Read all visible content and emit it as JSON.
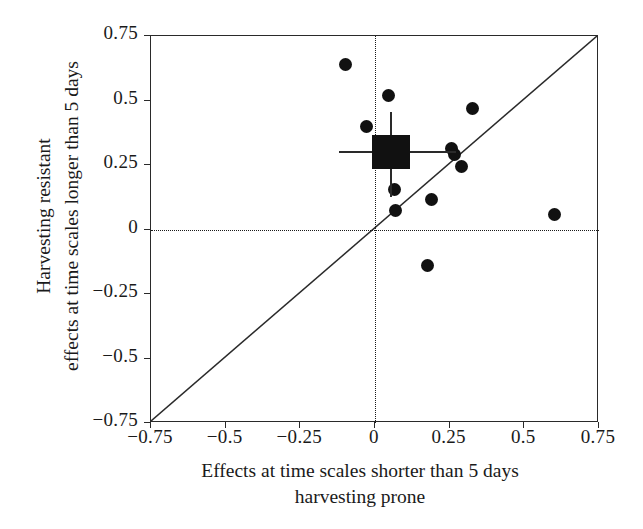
{
  "chart_data": {
    "type": "scatter",
    "title": "",
    "xlabel": "Effects at time scales shorter than 5 days harvesting prone",
    "xlabel_line1": "Effects at time scales shorter than 5 days",
    "xlabel_line2": "harvesting prone",
    "ylabel": "Harvesting resistant effects at time scales longer than 5 days",
    "ylabel_line1": "Harvesting resistant",
    "ylabel_line2": "effects at time scales longer than 5 days",
    "xlim": [
      -0.75,
      0.75
    ],
    "ylim": [
      -0.75,
      0.75
    ],
    "xticks": [
      -0.75,
      -0.5,
      -0.25,
      0,
      0.25,
      0.5,
      0.75
    ],
    "yticks": [
      -0.75,
      -0.5,
      -0.25,
      0,
      0.25,
      0.5,
      0.75
    ],
    "xticklabels": [
      "−0.75",
      "−0.5",
      "−0.25",
      "0",
      "0.25",
      "0.5",
      "0.75"
    ],
    "yticklabels": [
      "−0.75",
      "−0.5",
      "−0.25",
      "0",
      "0.25",
      "0.5",
      "0.75"
    ],
    "grid": false,
    "legend": null,
    "reference_lines": [
      {
        "name": "zero-horizontal",
        "orientation": "horizontal",
        "value": 0,
        "style": "dotted"
      },
      {
        "name": "zero-vertical",
        "orientation": "vertical",
        "value": 0,
        "style": "dotted"
      },
      {
        "name": "identity-line",
        "orientation": "diagonal",
        "from": [
          -0.75,
          -0.75
        ],
        "to": [
          0.75,
          0.75
        ],
        "style": "solid"
      }
    ],
    "points": [
      {
        "x": -0.1,
        "y": 0.64
      },
      {
        "x": -0.03,
        "y": 0.4
      },
      {
        "x": 0.045,
        "y": 0.52
      },
      {
        "x": 0.06,
        "y": 0.31
      },
      {
        "x": 0.065,
        "y": 0.155
      },
      {
        "x": 0.07,
        "y": 0.075
      },
      {
        "x": 0.175,
        "y": -0.14
      },
      {
        "x": 0.19,
        "y": 0.115
      },
      {
        "x": 0.255,
        "y": 0.315
      },
      {
        "x": 0.265,
        "y": 0.29
      },
      {
        "x": 0.29,
        "y": 0.245
      },
      {
        "x": 0.325,
        "y": 0.47
      },
      {
        "x": 0.6,
        "y": 0.06
      }
    ],
    "mean_marker": {
      "name": "overall-mean",
      "x": 0.055,
      "y": 0.3,
      "x_error_low": -0.12,
      "x_error_high": 0.27,
      "y_error_low": 0.125,
      "y_error_high": 0.455
    },
    "marker_color": "#111111",
    "axis_color": "#2a2a2a",
    "background_color": "#ffffff"
  }
}
